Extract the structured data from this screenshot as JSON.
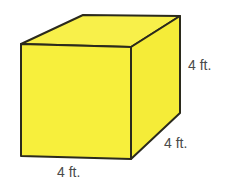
{
  "diagram": {
    "shape": "cube",
    "colors": {
      "fill": "#f7ef3c",
      "fill_top": "#f8f04a",
      "fill_side": "#f5ec38",
      "stroke": "#2b2a1c",
      "label": "#4a4a4a"
    },
    "labels": {
      "height": "4 ft.",
      "depth": "4 ft.",
      "width": "4 ft."
    }
  }
}
